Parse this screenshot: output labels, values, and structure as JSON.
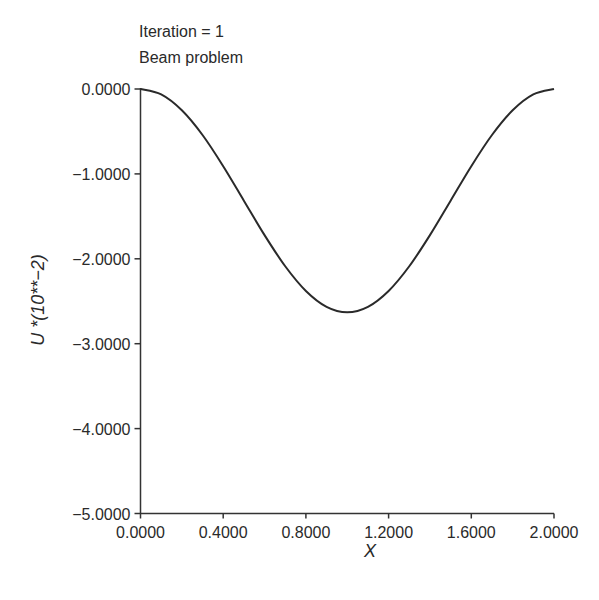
{
  "annotations": {
    "line1": "Iteration = 1",
    "line2": "Beam problem"
  },
  "axes": {
    "xlabel": "X",
    "ylabel": "U *(10**−2)"
  },
  "colors": {
    "line": "#2a2a2a",
    "axis": "#333333",
    "background": "#ffffff"
  },
  "chart_data": {
    "type": "line",
    "xlabel": "X",
    "ylabel": "U *(10**−2)",
    "xlim": [
      0.0,
      2.0
    ],
    "ylim": [
      -5.0,
      0.0
    ],
    "grid": false,
    "legend": null,
    "x_ticks": [
      "0.0000",
      "0.4000",
      "0.8000",
      "1.2000",
      "1.6000",
      "2.0000"
    ],
    "y_ticks": [
      "0.0000",
      "−1.0000",
      "−2.0000",
      "−3.0000",
      "−4.0000",
      "−5.0000"
    ],
    "x_tick_values": [
      0.0,
      0.4,
      0.8,
      1.2,
      1.6,
      2.0
    ],
    "y_tick_values": [
      0.0,
      -1.0,
      -2.0,
      -3.0,
      -4.0,
      -5.0
    ],
    "series": [
      {
        "name": "U",
        "x": [
          0.0,
          0.1,
          0.2,
          0.3,
          0.4,
          0.5,
          0.6,
          0.7,
          0.8,
          0.9,
          1.0,
          1.1,
          1.2,
          1.3,
          1.4,
          1.5,
          1.6,
          1.7,
          1.8,
          1.9,
          2.0
        ],
        "values": [
          0.0,
          -0.064,
          -0.251,
          -0.542,
          -0.909,
          -1.315,
          -1.721,
          -2.088,
          -2.379,
          -2.566,
          -2.63,
          -2.566,
          -2.379,
          -2.088,
          -1.721,
          -1.315,
          -0.909,
          -0.542,
          -0.251,
          -0.064,
          0.0
        ]
      }
    ],
    "annotations": [
      "Iteration = 1",
      "Beam problem"
    ]
  }
}
